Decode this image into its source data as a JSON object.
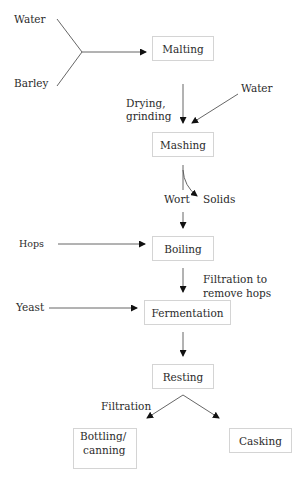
{
  "diagram": {
    "inputs": {
      "water_malting": "Water",
      "barley": "Barley",
      "water_mashing": "Water",
      "hops": "Hops",
      "yeast": "Yeast"
    },
    "steps": [
      {
        "id": "malting",
        "label": "Malting"
      },
      {
        "id": "mashing",
        "label": "Mashing"
      },
      {
        "id": "boiling",
        "label": "Boiling"
      },
      {
        "id": "fermentation",
        "label": "Fermentation"
      },
      {
        "id": "resting",
        "label": "Resting"
      },
      {
        "id": "bottling",
        "label": "Bottling/",
        "label2": "canning"
      },
      {
        "id": "casking",
        "label": "Casking"
      }
    ],
    "annotations": {
      "drying_line1": "Drying,",
      "drying_line2": "grinding",
      "wort": "Wort",
      "solids": "Solids",
      "filtration_hops_line1": "Filtration to",
      "filtration_hops_line2": "remove hops",
      "filtration": "Filtration"
    },
    "edges": [
      {
        "from": "Water",
        "to": "Malting"
      },
      {
        "from": "Barley",
        "to": "Malting"
      },
      {
        "from": "Malting",
        "to": "Mashing",
        "label": "Drying, grinding"
      },
      {
        "from": "Water",
        "to": "Mashing"
      },
      {
        "from": "Mashing",
        "to": "Solids"
      },
      {
        "from": "Mashing",
        "to": "Boiling",
        "label": "Wort"
      },
      {
        "from": "Hops",
        "to": "Boiling"
      },
      {
        "from": "Boiling",
        "to": "Fermentation",
        "label": "Filtration to remove hops"
      },
      {
        "from": "Yeast",
        "to": "Fermentation"
      },
      {
        "from": "Fermentation",
        "to": "Resting"
      },
      {
        "from": "Resting",
        "to": "Bottling/canning",
        "label": "Filtration"
      },
      {
        "from": "Resting",
        "to": "Casking"
      }
    ]
  }
}
